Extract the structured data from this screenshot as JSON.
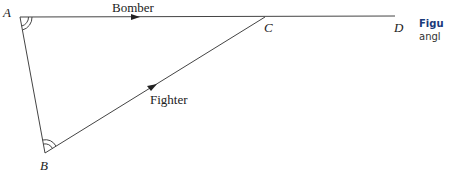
{
  "diagram": {
    "points": {
      "A": "A",
      "B": "B",
      "C": "C",
      "D": "D"
    },
    "edges": {
      "bomber": "Bomber",
      "fighter": "Fighter"
    }
  },
  "caption": {
    "title": "Figu",
    "text": "angl"
  },
  "colors": {
    "line": "#444444",
    "caption_title": "#1a3a7a"
  }
}
